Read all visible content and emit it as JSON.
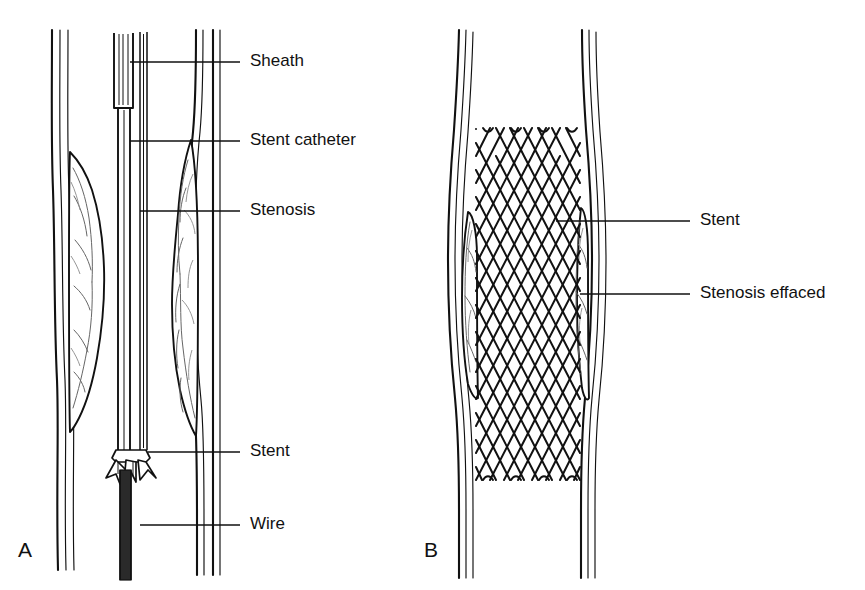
{
  "figure": {
    "background_color": "#ffffff",
    "line_color": "#111111",
    "width": 865,
    "height": 590
  },
  "panels": [
    {
      "id": "A",
      "label": "A",
      "caption": "Stent catheter advanced through sheath across stenosis",
      "labels": [
        {
          "key": "sheath",
          "text": "Sheath",
          "text_x": 250,
          "text_y": 62,
          "line_x1": 130,
          "line_x2": 240,
          "line_y": 62
        },
        {
          "key": "stent_catheter",
          "text": "Stent catheter",
          "text_x": 250,
          "text_y": 141,
          "line_x1": 130,
          "line_x2": 240,
          "line_y": 141
        },
        {
          "key": "stenosis",
          "text": "Stenosis",
          "text_x": 250,
          "text_y": 211,
          "line_x1": 140,
          "line_x2": 240,
          "line_y": 211
        },
        {
          "key": "stent",
          "text": "Stent",
          "text_x": 250,
          "text_y": 452,
          "line_x1": 148,
          "line_x2": 240,
          "line_y": 452
        },
        {
          "key": "wire",
          "text": "Wire",
          "text_x": 250,
          "text_y": 525,
          "line_x1": 140,
          "line_x2": 240,
          "line_y": 525
        }
      ]
    },
    {
      "id": "B",
      "label": "B",
      "caption": "Stent deployed, stenosis effaced",
      "labels": [
        {
          "key": "stent",
          "text": "Stent",
          "text_x": 700,
          "text_y": 221,
          "line_x1": 556,
          "line_x2": 690,
          "line_y": 221
        },
        {
          "key": "stenosis_effaced",
          "text": "Stenosis effaced",
          "text_x": 700,
          "text_y": 294,
          "line_x1": 580,
          "line_x2": 690,
          "line_y": 294
        }
      ]
    }
  ],
  "structures": {
    "vessel_wall": "double-line vessel wall",
    "plaque": "atherosclerotic stenosis plaque with lobulated interior",
    "sheath": "introducer sheath with hub",
    "catheter": "stent delivery catheter",
    "wire": "guidewire, hatched shaft",
    "stent_mesh": {
      "columns": 7,
      "rows": 13,
      "cell_width": 29,
      "cell_height": 27
    }
  }
}
